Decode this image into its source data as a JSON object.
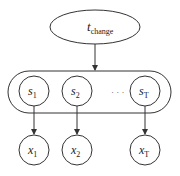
{
  "diagram": {
    "top_node": {
      "label": "t",
      "subscript": "change"
    },
    "group": {
      "states": [
        {
          "label": "s",
          "subscript": "1"
        },
        {
          "label": "s",
          "subscript": "2"
        },
        {
          "label": "s",
          "subscript": "T"
        }
      ],
      "ellipsis": "· · ·"
    },
    "observations": [
      {
        "label": "x",
        "subscript": "1"
      },
      {
        "label": "x",
        "subscript": "2"
      },
      {
        "label": "x",
        "subscript": "T"
      }
    ],
    "colors": {
      "stroke": "#333333",
      "background": "#ffffff"
    }
  }
}
